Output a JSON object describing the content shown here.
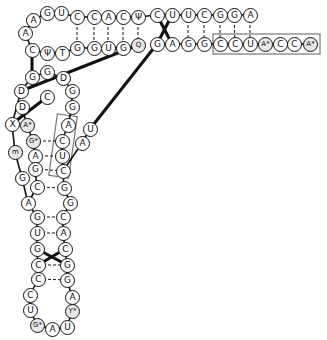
{
  "diagram": {
    "type": "tRNA cloverleaf tertiary structure (L-shape)",
    "colors": {
      "line": "#111111",
      "node_bg": "#ffffff",
      "modified_bg": "#e8e8e8",
      "box": "#777777"
    },
    "nucleotides": [
      {
        "id": "n1",
        "label": "A",
        "x": 33,
        "y": 20
      },
      {
        "id": "n2",
        "label": "G",
        "x": 47,
        "y": 13
      },
      {
        "id": "n3",
        "label": "U",
        "x": 61,
        "y": 13
      },
      {
        "id": "n4",
        "label": "C",
        "x": 77,
        "y": 17
      },
      {
        "id": "n5",
        "label": "C",
        "x": 94,
        "y": 17
      },
      {
        "id": "n6",
        "label": "A",
        "x": 108,
        "y": 17
      },
      {
        "id": "n7",
        "label": "C",
        "x": 123,
        "y": 17
      },
      {
        "id": "n8",
        "label": "Ψ",
        "x": 138,
        "y": 17
      },
      {
        "id": "n9",
        "label": "C",
        "x": 157,
        "y": 15
      },
      {
        "id": "n10",
        "label": "U",
        "x": 172,
        "y": 15
      },
      {
        "id": "n11",
        "label": "U",
        "x": 188,
        "y": 15
      },
      {
        "id": "n12",
        "label": "C",
        "x": 204,
        "y": 15
      },
      {
        "id": "n13",
        "label": "G",
        "x": 220,
        "y": 15
      },
      {
        "id": "n14",
        "label": "G",
        "x": 234,
        "y": 15
      },
      {
        "id": "n15",
        "label": "A",
        "x": 250,
        "y": 15
      },
      {
        "id": "b1",
        "label": "G",
        "x": 157,
        "y": 44
      },
      {
        "id": "b2",
        "label": "A",
        "x": 172,
        "y": 44
      },
      {
        "id": "b3",
        "label": "G",
        "x": 188,
        "y": 44
      },
      {
        "id": "b4",
        "label": "G",
        "x": 204,
        "y": 44
      },
      {
        "id": "b5",
        "label": "C",
        "x": 220,
        "y": 44
      },
      {
        "id": "b6",
        "label": "C",
        "x": 235,
        "y": 44
      },
      {
        "id": "b7",
        "label": "U",
        "x": 250,
        "y": 44
      },
      {
        "id": "b8",
        "label": "A*",
        "x": 265,
        "y": 44,
        "modified": true
      },
      {
        "id": "b9",
        "label": "C",
        "x": 280,
        "y": 44
      },
      {
        "id": "b10",
        "label": "C",
        "x": 294,
        "y": 44
      },
      {
        "id": "b11",
        "label": "A*",
        "x": 310,
        "y": 44,
        "modified": true
      },
      {
        "id": "l1",
        "label": "A",
        "x": 25,
        "y": 33
      },
      {
        "id": "l2",
        "label": "C",
        "x": 32,
        "y": 50
      },
      {
        "id": "l3",
        "label": "Ψ",
        "x": 47,
        "y": 53
      },
      {
        "id": "l4",
        "label": "T",
        "x": 62,
        "y": 53
      },
      {
        "id": "l5",
        "label": "G",
        "x": 77,
        "y": 48
      },
      {
        "id": "l6",
        "label": "G",
        "x": 94,
        "y": 48
      },
      {
        "id": "l7",
        "label": "U",
        "x": 108,
        "y": 48
      },
      {
        "id": "l8",
        "label": "G",
        "x": 123,
        "y": 48
      },
      {
        "id": "l9",
        "label": "Q",
        "x": 138,
        "y": 45,
        "modified": true
      },
      {
        "id": "d1",
        "label": "G",
        "x": 32,
        "y": 77
      },
      {
        "id": "d2",
        "label": "G",
        "x": 47,
        "y": 72
      },
      {
        "id": "d3",
        "label": "D",
        "x": 63,
        "y": 78
      },
      {
        "id": "d4",
        "label": "D",
        "x": 21,
        "y": 91
      },
      {
        "id": "d5",
        "label": "C",
        "x": 47,
        "y": 97
      },
      {
        "id": "d6",
        "label": "G",
        "x": 72,
        "y": 91
      },
      {
        "id": "d7",
        "label": "D",
        "x": 22,
        "y": 107
      },
      {
        "id": "d8",
        "label": "G",
        "x": 72,
        "y": 107
      },
      {
        "id": "d9",
        "label": "X",
        "x": 12,
        "y": 124
      },
      {
        "id": "d10",
        "label": "A*",
        "x": 27,
        "y": 125,
        "modified": true
      },
      {
        "id": "d11",
        "label": "A",
        "x": 68,
        "y": 125
      },
      {
        "id": "d12",
        "label": "U",
        "x": 90,
        "y": 129
      },
      {
        "id": "d13",
        "label": "G*",
        "x": 33,
        "y": 141,
        "modified": true
      },
      {
        "id": "d14",
        "label": "C",
        "x": 62,
        "y": 141
      },
      {
        "id": "d15",
        "label": "A",
        "x": 82,
        "y": 143
      },
      {
        "id": "d16",
        "label": "m",
        "x": 15,
        "y": 152,
        "modified": true
      },
      {
        "id": "d17",
        "label": "A",
        "x": 35,
        "y": 156
      },
      {
        "id": "d18",
        "label": "U",
        "x": 62,
        "y": 156
      },
      {
        "id": "d19",
        "label": "G",
        "x": 35,
        "y": 169
      },
      {
        "id": "d20",
        "label": "C",
        "x": 63,
        "y": 171
      },
      {
        "id": "d21",
        "label": "G",
        "x": 22,
        "y": 178
      },
      {
        "id": "d22",
        "label": "C",
        "x": 37,
        "y": 187
      },
      {
        "id": "d23",
        "label": "G",
        "x": 64,
        "y": 188
      },
      {
        "id": "a1",
        "label": "A",
        "x": 28,
        "y": 203
      },
      {
        "id": "a2",
        "label": "G",
        "x": 70,
        "y": 203
      },
      {
        "id": "a3",
        "label": "G",
        "x": 37,
        "y": 217
      },
      {
        "id": "a4",
        "label": "C",
        "x": 63,
        "y": 217
      },
      {
        "id": "a5",
        "label": "U",
        "x": 37,
        "y": 233
      },
      {
        "id": "a6",
        "label": "A",
        "x": 63,
        "y": 233
      },
      {
        "id": "a7",
        "label": "G",
        "x": 37,
        "y": 249
      },
      {
        "id": "a8",
        "label": "C",
        "x": 65,
        "y": 249
      },
      {
        "id": "a9",
        "label": "C",
        "x": 38,
        "y": 265
      },
      {
        "id": "a10",
        "label": "G",
        "x": 67,
        "y": 265
      },
      {
        "id": "a11",
        "label": "C",
        "x": 38,
        "y": 279
      },
      {
        "id": "a12",
        "label": "G",
        "x": 67,
        "y": 280
      },
      {
        "id": "a13",
        "label": "C",
        "x": 30,
        "y": 295
      },
      {
        "id": "a14",
        "label": "A",
        "x": 72,
        "y": 297
      },
      {
        "id": "a15",
        "label": "U",
        "x": 30,
        "y": 310
      },
      {
        "id": "a16",
        "label": "Y*",
        "x": 72,
        "y": 311,
        "modified": true
      },
      {
        "id": "a17",
        "label": "G*",
        "x": 37,
        "y": 325,
        "modified": true
      },
      {
        "id": "a18",
        "label": "A",
        "x": 52,
        "y": 329
      },
      {
        "id": "a19",
        "label": "U",
        "x": 67,
        "y": 327
      }
    ],
    "backbone": [
      [
        "b11",
        "b10",
        "b9",
        "b8",
        "b7",
        "b6",
        "b5",
        "b4",
        "b3",
        "b2",
        "b1"
      ],
      [
        "n15",
        "n14",
        "n13",
        "n12",
        "n11",
        "n10",
        "n9",
        "n8",
        "n7",
        "n6",
        "n5",
        "n4",
        "n3",
        "n2",
        "n1",
        "l1",
        "l2",
        "l3",
        "l4",
        "l5",
        "l6",
        "l7",
        "l8",
        "l9"
      ],
      [
        "d1",
        "d2",
        "d3",
        "d6",
        "d8",
        "d11",
        "d14",
        "d18",
        "d20",
        "d23",
        "a2",
        "a4",
        "a6",
        "a8",
        "a10",
        "a12",
        "a14",
        "a16",
        "a19",
        "a18",
        "a17",
        "a15",
        "a13",
        "a11",
        "a9",
        "a7",
        "a5",
        "a3",
        "a1",
        "d21",
        "d16",
        "d9",
        "d4",
        "d1"
      ],
      [
        "d7",
        "d10",
        "d13",
        "d17",
        "d19",
        "d22",
        "a1"
      ],
      [
        "d12",
        "d15",
        "d20"
      ]
    ],
    "thick_links": [
      [
        "l9",
        "d4"
      ],
      [
        "b1",
        "d12"
      ],
      [
        "n9",
        "b2"
      ],
      [
        "n10",
        "b1"
      ],
      [
        "l2",
        "d1"
      ],
      [
        "d5",
        "d9"
      ],
      [
        "a7",
        "a10"
      ],
      [
        "a8",
        "a9"
      ]
    ],
    "base_pairs": [
      [
        "n4",
        "l5"
      ],
      [
        "n5",
        "l6"
      ],
      [
        "n6",
        "l7"
      ],
      [
        "n7",
        "l8"
      ],
      [
        "n8",
        "l9"
      ],
      [
        "n11",
        "b3"
      ],
      [
        "n12",
        "b4"
      ],
      [
        "n13",
        "b5"
      ],
      [
        "n14",
        "b6"
      ],
      [
        "n15",
        "b7"
      ],
      [
        "d13",
        "d14"
      ],
      [
        "d17",
        "d18"
      ],
      [
        "d19",
        "d20"
      ],
      [
        "d22",
        "d23"
      ],
      [
        "a3",
        "a4"
      ],
      [
        "a5",
        "a6"
      ],
      [
        "a9",
        "a10"
      ],
      [
        "a11",
        "a12"
      ],
      [
        "l2",
        "d1"
      ]
    ],
    "boxes": [
      {
        "name": "acceptor-box",
        "x": 213,
        "y": 34,
        "w": 107,
        "h": 20
      },
      {
        "name": "d-stem-box",
        "x": 53,
        "y": 115,
        "w": 20,
        "h": 62,
        "rotate": 8
      }
    ]
  }
}
